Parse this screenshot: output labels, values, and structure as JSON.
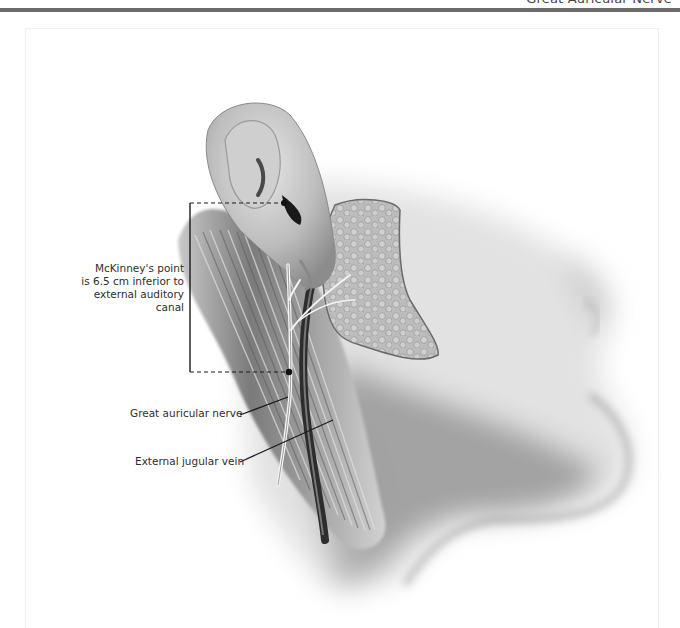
{
  "page": {
    "running_head": "Great Auricular Nerve"
  },
  "figure": {
    "labels": {
      "mckinney_line1": "McKinney's point",
      "mckinney_line2": "is 6.5 cm inferior to",
      "mckinney_line3": "external auditory canal",
      "great_auricular_nerve": "Great auricular nerve",
      "external_jugular_vein": "External jugular vein"
    },
    "structures": [
      "ear",
      "parotid gland",
      "sternocleidomastoid muscle",
      "great auricular nerve",
      "external jugular vein",
      "mandible",
      "chin"
    ],
    "measurement": {
      "distance": "6.5 cm",
      "from": "external auditory canal",
      "to": "McKinney's point"
    },
    "colors": {
      "header_rule": "#6b6b6b",
      "label_text": "#2e2e2e",
      "leader_line": "#1a1a1a"
    }
  }
}
